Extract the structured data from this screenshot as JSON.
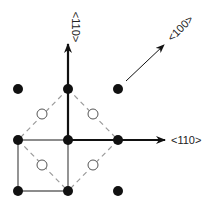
{
  "diagram": {
    "type": "crystal-lattice-directions",
    "colors": {
      "atom": "#111111",
      "open_site": "#555555",
      "solid_line": "#666666",
      "dashed_line": "#9a9a9a",
      "arrow": "#111111",
      "background": "#ffffff"
    },
    "labels": {
      "vertical_arrow": "<110>",
      "horizontal_arrow": "<110>",
      "diagonal_arrow": "<100>"
    },
    "filled_atoms": [
      {
        "x": 18,
        "y": 89
      },
      {
        "x": 68,
        "y": 89
      },
      {
        "x": 118,
        "y": 89
      },
      {
        "x": 18,
        "y": 140
      },
      {
        "x": 68,
        "y": 140
      },
      {
        "x": 118,
        "y": 140
      },
      {
        "x": 18,
        "y": 191
      },
      {
        "x": 68,
        "y": 191
      },
      {
        "x": 118,
        "y": 191
      }
    ],
    "open_sites": [
      {
        "x": 42,
        "y": 114
      },
      {
        "x": 93,
        "y": 114
      },
      {
        "x": 42,
        "y": 165
      },
      {
        "x": 93,
        "y": 165
      }
    ]
  }
}
